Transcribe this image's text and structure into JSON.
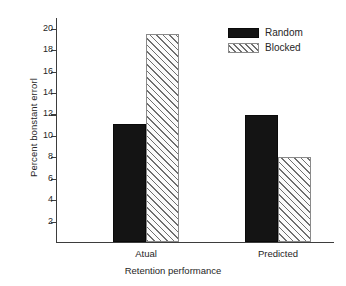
{
  "chart_data": {
    "type": "bar",
    "title": "",
    "xlabel": "Retention performance",
    "ylabel": "Percent bonstant errorl",
    "categories": [
      "Atual",
      "Predicted"
    ],
    "series": [
      {
        "name": "Random",
        "values": [
          11.0,
          11.9
        ],
        "style": "solid",
        "color": "#141414"
      },
      {
        "name": "Blocked",
        "values": [
          19.4,
          7.9
        ],
        "style": "hatch",
        "color": "#fbfbfb"
      }
    ],
    "ylim": [
      0,
      21
    ],
    "yticks": [
      2,
      4,
      6,
      8,
      10,
      12,
      14,
      16,
      18,
      20
    ],
    "ytick_labels": [
      "2",
      "4",
      "6",
      "8",
      "10",
      "12",
      "14",
      "16",
      "18",
      "20"
    ],
    "grid": false,
    "legend_position": "top-right",
    "axis_color": "#3d3d3d",
    "background": "#ffffff"
  },
  "legend": {
    "entries": [
      {
        "label": "Random",
        "swatch": "solid-black-swatch"
      },
      {
        "label": "Blocked",
        "swatch": "hatched-swatch"
      }
    ]
  }
}
